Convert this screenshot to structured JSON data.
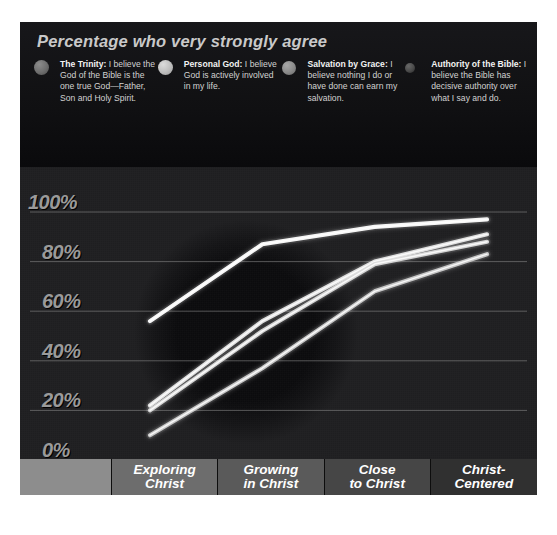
{
  "chart": {
    "title": "Percentage who very strongly agree",
    "legend": [
      {
        "name": "trinity",
        "title": "The Trinity:",
        "text": " I believe the God of the Bible is the one true God—Father, Son and Holy Spirit.",
        "color": "#6e6e6e",
        "size": 15
      },
      {
        "name": "personal-god",
        "title": "Personal God:",
        "text": " I believe God is actively involved in my life.",
        "color": "#bdbdbd",
        "size": 15
      },
      {
        "name": "salvation-by-grace",
        "title": "Salvation by Grace:",
        "text": " I believe nothing I do or have done can earn my salvation.",
        "color": "#8a8a8a",
        "size": 14
      },
      {
        "name": "authority-of-the-bible",
        "title": "Authority of the Bible:",
        "text": " I believe the Bible has decisive authority over what I say and do.",
        "color": "#4a4a4a",
        "size": 10
      }
    ]
  },
  "chart_data": {
    "type": "line",
    "title": "Percentage who very strongly agree",
    "xlabel": "",
    "ylabel": "Percentage",
    "ylim": [
      0,
      100
    ],
    "ytick_labels": [
      "100%",
      "80%",
      "60%",
      "40%",
      "20%",
      "0%"
    ],
    "yticks": [
      100,
      80,
      60,
      40,
      20,
      0
    ],
    "grid": true,
    "legend_position": "top",
    "categories": [
      "Exploring Christ",
      "Growing in Christ",
      "Close to Christ",
      "Christ-Centered"
    ],
    "series": [
      {
        "name": "Personal God",
        "color": "#ffffff",
        "values": [
          56,
          87,
          94,
          97
        ]
      },
      {
        "name": "The Trinity",
        "color": "#e8e8e8",
        "values": [
          22,
          56,
          80,
          91
        ]
      },
      {
        "name": "Salvation by Grace",
        "color": "#dcdcdc",
        "values": [
          20,
          52,
          79,
          88
        ]
      },
      {
        "name": "Authority of the Bible",
        "color": "#cfcfcf",
        "values": [
          10,
          37,
          68,
          83
        ]
      }
    ]
  },
  "xaxis": {
    "spacer": "",
    "cells": [
      "Exploring\nChrist",
      "Growing\nin Christ",
      "Close\nto Christ",
      "Christ-\nCentered"
    ],
    "line1": [
      "Exploring",
      "Growing",
      "Close",
      "Christ-"
    ],
    "line2": [
      "Christ",
      "in Christ",
      "to Christ",
      "Centered"
    ]
  },
  "colors": {
    "panel_bg": "#111111",
    "plot_bg": "#1e1e20",
    "gridline": "#8f8f8f",
    "ylabel": "#9a9a9a",
    "title": "#c9c9c9"
  }
}
